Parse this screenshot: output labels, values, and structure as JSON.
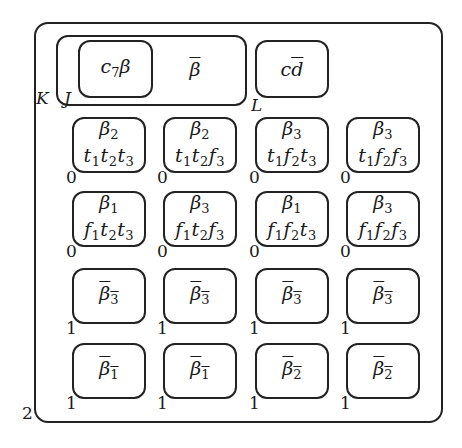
{
  "diagram": {
    "outer_label": "2",
    "labels": {
      "K": "K",
      "J": "J",
      "L": "L"
    },
    "top_row": {
      "j_group": [
        {
          "base": "c",
          "sub": "7",
          "tail": "β",
          "overline": false,
          "boxed": true
        },
        {
          "base": "β",
          "sub": "",
          "tail": "",
          "overline": true,
          "boxed": false
        }
      ],
      "l_group": {
        "text": "cd",
        "overline_on": "d"
      }
    },
    "grid": [
      [
        {
          "top": "β",
          "top_sub": "2",
          "terms": [
            [
              "t",
              "1"
            ],
            [
              "t",
              "2"
            ],
            [
              "t",
              "3"
            ]
          ],
          "corner": "0"
        },
        {
          "top": "β",
          "top_sub": "2",
          "terms": [
            [
              "t",
              "1"
            ],
            [
              "t",
              "2"
            ],
            [
              "f",
              "3"
            ]
          ],
          "corner": "0"
        },
        {
          "top": "β",
          "top_sub": "3",
          "terms": [
            [
              "t",
              "1"
            ],
            [
              "f",
              "2"
            ],
            [
              "t",
              "3"
            ]
          ],
          "corner": "0"
        },
        {
          "top": "β",
          "top_sub": "3",
          "terms": [
            [
              "t",
              "1"
            ],
            [
              "f",
              "2"
            ],
            [
              "f",
              "3"
            ]
          ],
          "corner": "0"
        }
      ],
      [
        {
          "top": "β",
          "top_sub": "1",
          "terms": [
            [
              "f",
              "1"
            ],
            [
              "t",
              "2"
            ],
            [
              "t",
              "3"
            ]
          ],
          "corner": "0"
        },
        {
          "top": "β",
          "top_sub": "3",
          "terms": [
            [
              "f",
              "1"
            ],
            [
              "t",
              "2"
            ],
            [
              "f",
              "3"
            ]
          ],
          "corner": "0"
        },
        {
          "top": "β",
          "top_sub": "1",
          "terms": [
            [
              "f",
              "1"
            ],
            [
              "f",
              "2"
            ],
            [
              "t",
              "3"
            ]
          ],
          "corner": "0"
        },
        {
          "top": "β",
          "top_sub": "3",
          "terms": [
            [
              "f",
              "1"
            ],
            [
              "f",
              "2"
            ],
            [
              "f",
              "3"
            ]
          ],
          "corner": "0"
        }
      ],
      [
        {
          "bar": "β",
          "bar_sub": "3",
          "corner": "1"
        },
        {
          "bar": "β",
          "bar_sub": "3",
          "corner": "1"
        },
        {
          "bar": "β",
          "bar_sub": "3",
          "corner": "1"
        },
        {
          "bar": "β",
          "bar_sub": "3",
          "corner": "1"
        }
      ],
      [
        {
          "bar": "β",
          "bar_sub": "1",
          "corner": "1"
        },
        {
          "bar": "β",
          "bar_sub": "1",
          "corner": "1"
        },
        {
          "bar": "β",
          "bar_sub": "2",
          "corner": "1"
        },
        {
          "bar": "β",
          "bar_sub": "2",
          "corner": "1"
        }
      ]
    ]
  }
}
